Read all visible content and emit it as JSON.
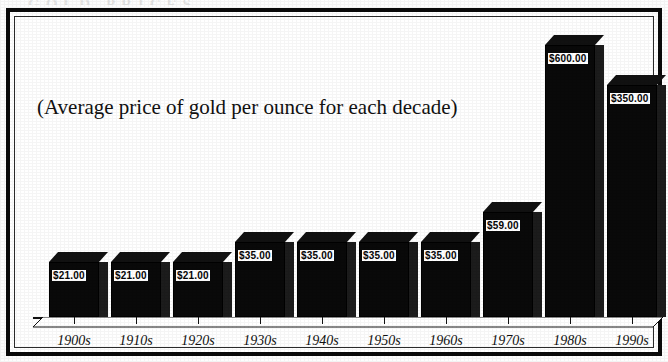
{
  "ghost_title_fragment": "GOLD PRICES",
  "subtitle": "(Average price of gold per ounce for each decade)",
  "chart_data": {
    "type": "bar",
    "title": "",
    "subtitle": "(Average price of gold per ounce for each decade)",
    "xlabel": "",
    "ylabel": "",
    "grid": false,
    "legend": "none",
    "axis_style": "3d-bars",
    "currency": "USD",
    "categories": [
      "1900s",
      "1910s",
      "1920s",
      "1930s",
      "1940s",
      "1950s",
      "1960s",
      "1970s",
      "1980s",
      "1990s"
    ],
    "values": [
      21.0,
      21.0,
      21.0,
      35.0,
      35.0,
      35.0,
      35.0,
      59.0,
      600.0,
      350.0
    ],
    "value_labels": [
      "$21.00",
      "$21.00",
      "$21.00",
      "$35.00",
      "$35.00",
      "$35.00",
      "$35.00",
      "$59.00",
      "$600.00",
      "$350.00"
    ],
    "ylim": [
      0,
      600
    ],
    "bars": [
      {
        "category": "1900s",
        "value": 21.0,
        "label": "$21.00",
        "x": 34,
        "width": 50,
        "height": 55
      },
      {
        "category": "1910s",
        "value": 21.0,
        "label": "$21.00",
        "x": 96,
        "width": 50,
        "height": 55
      },
      {
        "category": "1920s",
        "value": 21.0,
        "label": "$21.00",
        "x": 158,
        "width": 50,
        "height": 55
      },
      {
        "category": "1930s",
        "value": 35.0,
        "label": "$35.00",
        "x": 220,
        "width": 50,
        "height": 75
      },
      {
        "category": "1940s",
        "value": 35.0,
        "label": "$35.00",
        "x": 282,
        "width": 50,
        "height": 75
      },
      {
        "category": "1950s",
        "value": 35.0,
        "label": "$35.00",
        "x": 344,
        "width": 50,
        "height": 75
      },
      {
        "category": "1960s",
        "value": 35.0,
        "label": "$35.00",
        "x": 406,
        "width": 50,
        "height": 75
      },
      {
        "category": "1970s",
        "value": 59.0,
        "label": "$59.00",
        "x": 468,
        "width": 50,
        "height": 105
      },
      {
        "category": "1980s",
        "value": 600.0,
        "label": "$600.00",
        "x": 530,
        "width": 50,
        "height": 272
      },
      {
        "category": "1990s",
        "value": 350.0,
        "label": "$350.00",
        "x": 592,
        "width": 50,
        "height": 232
      }
    ]
  },
  "colors": {
    "bar_face": "#090909",
    "bar_side": "#1c1c1c",
    "bar_top": "#111111",
    "frame": "#0a0a0a",
    "background": "#ffffff",
    "label_bg": "#ffffff",
    "label_text": "#050505"
  }
}
